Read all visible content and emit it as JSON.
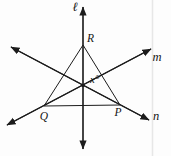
{
  "figure": {
    "canvas": {
      "width": 171,
      "height": 156
    },
    "background": "#fdfdfd",
    "stroke_color": "#1c1c1c",
    "scan_line": {
      "x": 152.5,
      "color": "#e7e7e7"
    },
    "triangle": {
      "name": "triangle-QRP",
      "vertices": [
        {
          "label": "R",
          "x": 83,
          "y": 45,
          "label_x": 90.5,
          "label_y": 42
        },
        {
          "label": "Q",
          "x": 44,
          "y": 106,
          "label_x": 44,
          "label_y": 119.5
        },
        {
          "label": "P",
          "x": 120,
          "y": 105,
          "label_x": 118,
          "label_y": 116
        }
      ]
    },
    "lines": [
      {
        "name": "l",
        "label": "ℓ",
        "x1": 83,
        "y1": 149,
        "x2": 83,
        "y2": 7,
        "label_x": 75,
        "label_y": 11
      },
      {
        "name": "m",
        "label": "m",
        "x1": 7,
        "y1": 125,
        "x2": 151,
        "y2": 49,
        "label_x": 157,
        "label_y": 61
      },
      {
        "name": "n",
        "label": "n",
        "x1": 11,
        "y1": 47,
        "x2": 149,
        "y2": 120,
        "label_x": 156,
        "label_y": 120
      }
    ],
    "angle_label": {
      "text": "x°",
      "x": 90,
      "y": 83
    },
    "intersection_dot": {
      "x": 83,
      "y": 85.5,
      "r": 1.7
    }
  }
}
